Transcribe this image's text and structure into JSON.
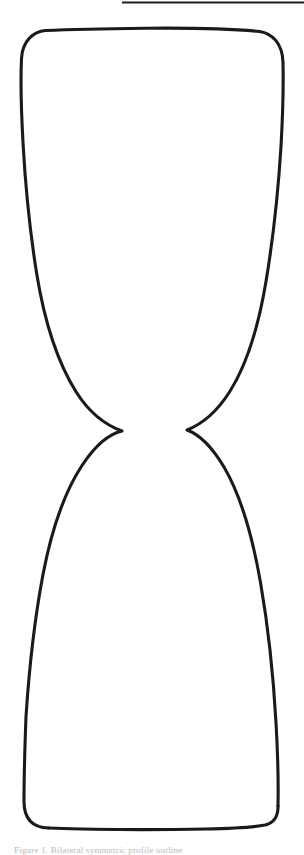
{
  "page": {
    "width": 304,
    "height": 855,
    "background_color": "#ffffff",
    "document_type": "scanned-line-drawing"
  },
  "rule": {
    "name": "top-horizontal-rule",
    "x1": 122,
    "y1": 2.5,
    "x2": 304,
    "y2": 2.5,
    "stroke_color": "#1d1d1d",
    "stroke_width": 2.2
  },
  "figure": {
    "stroke_color": "#1a1a1a",
    "stroke_width": 3.1,
    "fill": "none",
    "upper_bulb": {
      "top_edge_y": 30,
      "corner_radius": 26,
      "left_x": 21,
      "right_x": 283,
      "widest_y": 120
    },
    "waist": {
      "left_cusp_x": 122,
      "left_cusp_y": 431,
      "right_cusp_x": 187,
      "right_cusp_y": 430
    },
    "lower_bulb": {
      "bottom_edge_y": 828,
      "corner_radius": 26,
      "left_x": 24,
      "right_x": 278,
      "widest_y": 740
    },
    "left_outline_path": "M 45.5 30.5 C 33.5 31.5 22.5 40.5 21.5 58.5 C 20.5 80.5 21.2 110.5 23.0 142.5 C 25.2 182.5 29.5 228.5 36.5 272.5 C 44.5 322.5 57.5 362.5 76.5 392.5 C 92.5 417.5 109.5 426.5 122.0 431.0 C 111.0 433.5 96.5 443.5 82.0 465.5 C 65.5 490.5 52.0 527.5 43.0 574.5 C 34.5 619.5 29.0 670.5 26.0 716.5 C 24.6 753.5 24.0 782.5 24.0 801.5 C 24.0 818.5 32.5 827.5 48.5 828.0",
    "bottom_edge_path": "M 48.5 828.0 C 90.5 829.5 150.5 830.0 205.5 829.0 C 235.5 828.4 255.5 827.0 265.0 825.0 C 273.5 823.0 278.2 816.5 278.0 806.0",
    "right_outline_path": "M 278.0 806.0 C 278.4 786.5 278.0 757.5 276.0 722.5 C 273.5 678.5 268.5 628.5 260.5 582.5 C 252.0 533.5 239.5 493.5 224.0 467.0 C 210.0 443.5 196.5 433.5 187.0 430.0 C 198.5 425.5 214.5 415.5 229.5 392.0 C 247.0 364.5 258.5 326.5 266.0 281.5 C 273.5 236.5 278.5 186.5 281.0 146.5 C 282.8 114.5 283.5 84.5 283.0 62.5 C 282.5 43.5 272.5 33.5 259.5 31.5",
    "top_edge_path": "M 259.5 31.5 C 232.5 28.8 185.5 27.8 145.5 28.2 C 105.5 28.6 68.5 29.4 45.5 30.5"
  },
  "caption": {
    "name": "clipped-footer-caption",
    "text": "Figure 1. Bilateral symmetric profile outline",
    "visibility": "clipped-at-page-edge",
    "color": "#b9b9b9"
  }
}
